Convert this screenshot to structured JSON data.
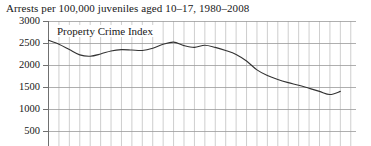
{
  "chart_data": {
    "type": "line",
    "title": "Arrests per 100,000 juveniles aged 10–17, 1980–2008",
    "xlabel": "",
    "ylabel": "",
    "ylim": [
      250,
      3000
    ],
    "ytick_labels": [
      "3000",
      "2500",
      "2000",
      "1500",
      "1000",
      "500"
    ],
    "ytick_values": [
      3000,
      2500,
      2000,
      1500,
      1000,
      500
    ],
    "grid": true,
    "legend_position": "inside-top-left",
    "x": [
      1980,
      1981,
      1982,
      1983,
      1984,
      1985,
      1986,
      1987,
      1988,
      1989,
      1990,
      1991,
      1992,
      1993,
      1994,
      1995,
      1996,
      1997,
      1998,
      1999,
      2000,
      2001,
      2002,
      2003,
      2004,
      2005,
      2006,
      2007,
      2008
    ],
    "xtick_labels": [],
    "series": [
      {
        "name": "Property Crime Index",
        "color": "#333333",
        "values": [
          2560,
          2470,
          2350,
          2230,
          2200,
          2250,
          2320,
          2350,
          2340,
          2330,
          2380,
          2470,
          2520,
          2440,
          2400,
          2450,
          2400,
          2330,
          2240,
          2090,
          1890,
          1760,
          1670,
          1600,
          1540,
          1470,
          1400,
          1330,
          1400
        ]
      }
    ],
    "annotations": [
      {
        "text": "Property Crime Index",
        "position": "inside-plot-top-left"
      }
    ]
  },
  "axis": {
    "y_labels": [
      "3000",
      "2500",
      "2000",
      "1500",
      "1000",
      "500"
    ]
  },
  "title": {
    "text": "Arrests per 100,000 juveniles aged 10–17, 1980–2008"
  },
  "series_label": {
    "text": "Property Crime Index"
  },
  "style": {
    "line_color": "#333333",
    "grid_color": "#b9b9b9",
    "major_grid_color": "#9a9a9a",
    "axis_color": "#707070",
    "text_color": "#171717",
    "background": "#ffffff"
  }
}
